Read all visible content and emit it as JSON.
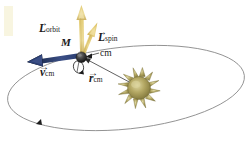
{
  "figure": {
    "type": "physics-vector-diagram",
    "background": "#ffffff",
    "width": 252,
    "height": 146
  },
  "colors": {
    "orbit_arrow": "#e8d585",
    "orbit_arrow_dark": "#c9ae58",
    "spin_arrow": "#e2c762",
    "spin_arrow_dark": "#b99a3c",
    "velocity_arrow": "#2c3f73",
    "velocity_arrow_light": "#4f6396",
    "orbit_path": "#8c8c8c",
    "radius_line": "#5a5a5a",
    "planet_body": "#2b2b2b",
    "planet_highlight": "#6e6e6e",
    "sun_body": "#9a8f4e",
    "sun_highlight": "#d8cf96",
    "sun_ray": "#8a7f42",
    "label_text": "#1a1a1a",
    "smudge": "#f6f2d8"
  },
  "labels": {
    "mass": {
      "text": "M",
      "x": 62,
      "y": 42,
      "size": 11
    },
    "orbital_angular_momentum": {
      "symbol": "L",
      "subscript": "orbit",
      "arrow": "→",
      "x": 40,
      "y": 28,
      "size": 11
    },
    "spin_angular_momentum": {
      "symbol": "L",
      "subscript": "spin",
      "arrow": "→",
      "x": 99,
      "y": 37,
      "size": 11
    },
    "velocity_cm": {
      "symbol": "v",
      "subscript": "cm",
      "arrow": "→",
      "x": 41,
      "y": 72,
      "size": 11
    },
    "radius_cm": {
      "symbol": "r",
      "subscript": "cm",
      "arrow": "→",
      "x": 90,
      "y": 78,
      "size": 11
    },
    "center_of_mass": {
      "text": "cm",
      "x": 100,
      "y": 55,
      "size": 9
    }
  },
  "geometry": {
    "orbit_ellipse": {
      "cx": 126,
      "cy": 88,
      "rx": 119,
      "ry": 41,
      "rotation_deg": -6,
      "stroke": "#8c8c8c",
      "stroke_width": 0.9
    },
    "planet": {
      "cx": 81,
      "cy": 57,
      "r": 5.2
    },
    "sun": {
      "cx": 139,
      "cy": 88,
      "core_r": 12,
      "ray_count": 12,
      "ray_length": 9
    },
    "orbit_vector": {
      "x1": 82,
      "y1": 55,
      "x2": 85,
      "y2": 8
    },
    "spin_vector": {
      "x1": 82,
      "y1": 54,
      "x2": 96,
      "y2": 22
    },
    "velocity_vector": {
      "x1": 78,
      "y1": 55,
      "x2": 29,
      "y2": 64
    },
    "radius_vector": {
      "x1": 131,
      "y1": 83,
      "x2": 85,
      "y2": 59
    },
    "cm_leader": {
      "x1": 97,
      "y1": 53,
      "x2": 85,
      "y2": 58
    },
    "orbit_direction_marker": {
      "x": 38,
      "y": 122
    },
    "spin_loop": {
      "cx": 79,
      "cy": 67,
      "rx": 5,
      "ry": 6
    }
  },
  "physics": {
    "described_quantities": [
      "M",
      "L_orbit",
      "L_spin",
      "v_cm",
      "r_cm",
      "cm"
    ]
  }
}
